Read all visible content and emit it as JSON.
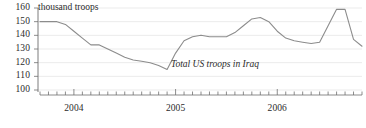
{
  "chart_data": {
    "type": "line",
    "title": "",
    "subtitle": "",
    "annotation": "Total US troops in Iraq",
    "unit_label": "thousand troops",
    "xlabel": "",
    "ylabel": "thousand troops",
    "ylim": [
      100,
      160
    ],
    "yticks": [
      100,
      110,
      120,
      130,
      140,
      150,
      160
    ],
    "ytick_labels": [
      "100",
      "110",
      "120",
      "130",
      "140",
      "150",
      "160"
    ],
    "grid": true,
    "grid_axis": "y",
    "legend": "none",
    "xlim": [
      "2003-09",
      "2006-11"
    ],
    "xtick_major_labels": [
      "2004",
      "2005",
      "2006"
    ],
    "xtick_minor_interval": "month",
    "line_color": "#8c8c8c",
    "grid_color": "#e2e2e2",
    "axis_color": "#6e6e6e",
    "text_color": "#2b2b2b",
    "background": "#ffffff",
    "x": [
      "2003-09",
      "2003-10",
      "2003-11",
      "2003-12",
      "2004-01",
      "2004-02",
      "2004-03",
      "2004-04",
      "2004-05",
      "2004-06",
      "2004-07",
      "2004-08",
      "2004-09",
      "2004-10",
      "2004-11",
      "2004-12",
      "2005-01",
      "2005-02",
      "2005-03",
      "2005-04",
      "2005-05",
      "2005-06",
      "2005-07",
      "2005-08",
      "2005-09",
      "2005-10",
      "2005-11",
      "2005-12",
      "2006-01",
      "2006-02",
      "2006-03",
      "2006-04",
      "2006-05",
      "2006-06",
      "2006-07",
      "2006-08",
      "2006-09",
      "2006-10",
      "2006-11"
    ],
    "values": [
      150,
      150,
      150,
      148,
      143,
      138,
      133,
      133,
      130,
      127,
      124,
      122,
      121,
      120,
      118,
      115,
      127,
      136,
      139,
      140,
      139,
      139,
      139,
      142,
      147,
      152,
      153,
      150,
      143,
      138,
      136,
      135,
      134,
      135,
      147,
      159,
      159,
      137,
      132
    ],
    "series": [
      {
        "name": "Total US troops in Iraq",
        "values": [
          150,
          150,
          150,
          148,
          143,
          138,
          133,
          133,
          130,
          127,
          124,
          122,
          121,
          120,
          118,
          115,
          127,
          136,
          139,
          140,
          139,
          139,
          139,
          142,
          147,
          152,
          153,
          150,
          143,
          138,
          136,
          135,
          134,
          135,
          147,
          159,
          159,
          137,
          132
        ]
      }
    ]
  }
}
